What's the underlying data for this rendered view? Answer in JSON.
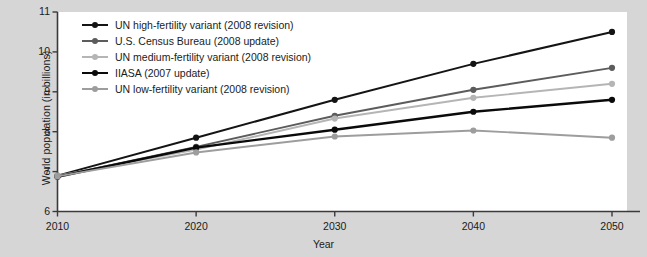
{
  "chart_data": {
    "type": "line",
    "title": "",
    "xlabel": "Year",
    "ylabel": "World population (in billions)",
    "x": [
      2010,
      2020,
      2030,
      2040,
      2050
    ],
    "xticklabels": [
      "2010",
      "2020",
      "2030",
      "2040",
      "2050"
    ],
    "yticklabels": [
      "6",
      "7",
      "8",
      "9",
      "10",
      "11"
    ],
    "ylim": [
      6,
      11
    ],
    "xlim": [
      2010,
      2050
    ],
    "grid": false,
    "legend_position": "top-left",
    "series": [
      {
        "name": "UN high-fertility variant (2008 revision)",
        "color": "#141414",
        "width": 2.0,
        "marker": "circle",
        "values": [
          6.9,
          7.85,
          8.8,
          9.7,
          10.5
        ]
      },
      {
        "name": "U.S. Census Bureau (2008 update)",
        "color": "#5c5c5c",
        "width": 1.9,
        "marker": "circle",
        "values": [
          6.88,
          7.62,
          8.4,
          9.05,
          9.6
        ]
      },
      {
        "name": "UN medium-fertility variant (2008 revision)",
        "color": "#b5b5b5",
        "width": 1.9,
        "marker": "circle",
        "values": [
          6.9,
          7.55,
          8.33,
          8.85,
          9.2
        ]
      },
      {
        "name": "IIASA (2007 update)",
        "color": "#0a0a0a",
        "width": 2.4,
        "marker": "circle",
        "values": [
          6.87,
          7.6,
          8.05,
          8.5,
          8.8
        ]
      },
      {
        "name": "UN low-fertility variant (2008 revision)",
        "color": "#9d9d9d",
        "width": 1.9,
        "marker": "circle",
        "values": [
          6.88,
          7.48,
          7.88,
          8.03,
          7.85
        ]
      }
    ]
  },
  "colors": {
    "page_background": "#d6d6d6",
    "plot_background": "#ffffff",
    "axis": "#3a3a3a",
    "text": "#1b1b1b"
  }
}
